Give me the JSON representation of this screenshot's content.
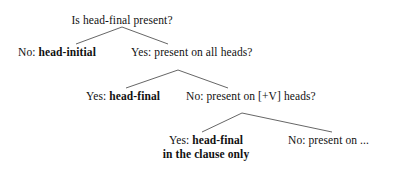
{
  "figure": {
    "type": "decision-tree",
    "background_color": "#ffffff",
    "text_color": "#111111",
    "line_color": "#555555",
    "nodes": [
      {
        "id": "root",
        "question": "Is head-final present?",
        "lead": "",
        "bold": "",
        "x": 122,
        "y": 15
      },
      {
        "id": "no-head-initial",
        "lead": "No: ",
        "bold": "head-initial",
        "x": 18,
        "y": 47
      },
      {
        "id": "yes-all-heads",
        "lead": "Yes: present on all heads?",
        "bold": "",
        "x": 131,
        "y": 47
      },
      {
        "id": "yes-head-final",
        "lead": "Yes: ",
        "bold": "head-final",
        "x": 86,
        "y": 91
      },
      {
        "id": "no-plus-v-heads",
        "lead": "No: present on [+V] heads?",
        "bold": "",
        "x": 186,
        "y": 91
      },
      {
        "id": "yes-head-final-clause",
        "lead": "Yes: ",
        "bold": "head-final",
        "line2": "in the clause only",
        "x": 206,
        "y": 135
      },
      {
        "id": "no-present-on-etc",
        "lead": "No: present on ...",
        "bold": "",
        "x": 288,
        "y": 135
      }
    ],
    "edges": [
      {
        "id": "root-to-head-initial",
        "x1": 122,
        "y1": 27,
        "x2": 76,
        "y2": 44
      },
      {
        "id": "root-to-all-heads",
        "x1": 122,
        "y1": 27,
        "x2": 168,
        "y2": 44
      },
      {
        "id": "all-heads-to-head-final",
        "x1": 178,
        "y1": 70,
        "x2": 126,
        "y2": 88
      },
      {
        "id": "all-heads-to-plus-v",
        "x1": 178,
        "y1": 70,
        "x2": 228,
        "y2": 88
      },
      {
        "id": "plus-v-to-clause-only",
        "x1": 242,
        "y1": 113,
        "x2": 202,
        "y2": 132
      },
      {
        "id": "plus-v-to-present-on",
        "x1": 242,
        "y1": 113,
        "x2": 332,
        "y2": 132
      }
    ]
  }
}
